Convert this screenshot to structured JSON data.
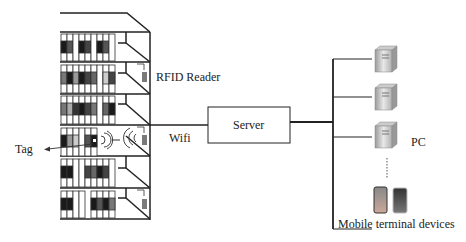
{
  "diagram": {
    "labels": {
      "rfid_reader": "RFID Reader",
      "tag": "Tag",
      "wifi": "Wifi",
      "server": "Server",
      "pc": "PC",
      "mobile": "Mobile terminal devices"
    },
    "components": {
      "bookshelf": {
        "shelves": 6,
        "readers": 3
      },
      "pcs": 3,
      "mobile_devices": 2
    },
    "colors": {
      "line": "#222222",
      "book_dark": "#1a1a1a",
      "book_mid": "#6a6a6a",
      "book_light": "#ffffff",
      "reader": "#7a7a7a"
    }
  }
}
